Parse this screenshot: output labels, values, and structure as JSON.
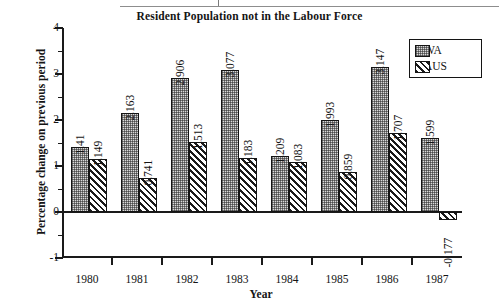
{
  "chart_data": {
    "type": "bar",
    "title": "Resident Population not in the Labour Force",
    "xlabel": "Year",
    "ylabel": "Percentage change on previous period",
    "categories": [
      "1980",
      "1981",
      "1982",
      "1983",
      "1984",
      "1985",
      "1986",
      "1987"
    ],
    "series": [
      {
        "name": "WA",
        "pattern": "stipple-dots",
        "values": [
          1.41,
          2.163,
          2.906,
          3.077,
          1.209,
          1.993,
          3.147,
          1.599
        ],
        "labels": [
          "1.41",
          "2.163",
          "2.906",
          "3.077",
          "1.209",
          "1.993",
          "3.147",
          "1.599"
        ]
      },
      {
        "name": "AUS",
        "pattern": "diagonal-hatch",
        "values": [
          1.149,
          0.741,
          1.513,
          1.183,
          1.083,
          0.859,
          1.707,
          -0.177
        ],
        "labels": [
          "1.149",
          "0.741",
          "1.513",
          "1.183",
          "1.083",
          "0.859",
          "1.707",
          "-0.177"
        ]
      }
    ],
    "ylim": [
      -1,
      4
    ],
    "ytick_labels": [
      "4",
      "3",
      "2",
      "1",
      "0",
      "-1"
    ],
    "ytick_values": [
      4,
      3,
      2,
      1,
      0,
      -1
    ],
    "yminor_values": [
      3.5,
      2.5,
      1.5,
      0.5,
      -0.5
    ],
    "grid": false,
    "legend": {
      "position": "top-right",
      "entries": [
        "WA",
        "AUS"
      ]
    }
  },
  "colors": {
    "axis": "#1a1a1a",
    "wa_fill": "#d9d9d9",
    "aus_fill": "#ffffff",
    "text": "#141414"
  }
}
